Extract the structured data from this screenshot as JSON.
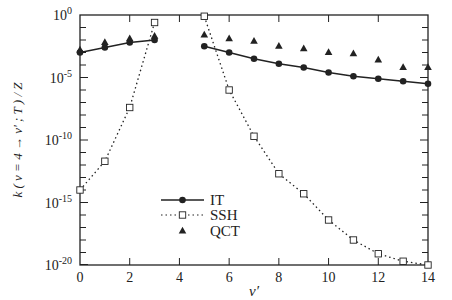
{
  "chart_data": {
    "type": "line",
    "title": "",
    "xlabel": "v′",
    "ylabel": "k ( v = 4 → v′ ; T ) / Z",
    "xlim": [
      0,
      14
    ],
    "ylim_log10": [
      -20,
      0
    ],
    "yscale": "log",
    "grid": false,
    "legend_position": "lower-left-center",
    "x_ticks": [
      0,
      2,
      4,
      6,
      8,
      10,
      12,
      14
    ],
    "x_tick_labels": [
      "0",
      "2",
      "4",
      "6",
      "8",
      "10",
      "12",
      "14"
    ],
    "y_ticks_log10": [
      0,
      -5,
      -10,
      -15,
      -20
    ],
    "y_tick_labels": [
      {
        "base": "10",
        "exp": "0"
      },
      {
        "base": "10",
        "exp": "-5"
      },
      {
        "base": "10",
        "exp": "-10"
      },
      {
        "base": "10",
        "exp": "-15"
      },
      {
        "base": "10",
        "exp": "-20"
      }
    ],
    "series": [
      {
        "name": "IT",
        "style": "solid-line-filled-circle",
        "segments": [
          {
            "x": [
              0,
              1,
              2,
              3
            ],
            "log10_y": [
              -3.0,
              -2.6,
              -2.2,
              -2.0
            ]
          },
          {
            "x": [
              5,
              6,
              7,
              8,
              9,
              10,
              11,
              12,
              13,
              14
            ],
            "log10_y": [
              -2.5,
              -3.0,
              -3.5,
              -3.9,
              -4.2,
              -4.6,
              -4.9,
              -5.1,
              -5.3,
              -5.5
            ]
          }
        ]
      },
      {
        "name": "SSH",
        "style": "dotted-line-open-square",
        "segments": [
          {
            "x": [
              0,
              1,
              2,
              3
            ],
            "log10_y": [
              -14.0,
              -11.7,
              -7.4,
              -0.6
            ]
          },
          {
            "x": [
              5,
              6,
              7,
              8,
              9,
              10,
              11,
              12,
              13,
              14
            ],
            "log10_y": [
              -0.1,
              -6.0,
              -9.7,
              -12.7,
              -14.3,
              -16.4,
              -18.0,
              -19.1,
              -19.7,
              -20.0
            ]
          }
        ]
      },
      {
        "name": "QCT",
        "style": "filled-triangle-markers",
        "segments": [
          {
            "x": [
              0,
              1,
              2,
              3
            ],
            "log10_y": [
              -2.8,
              -2.2,
              -1.9,
              -1.7
            ]
          },
          {
            "x": [
              5,
              6,
              7,
              8,
              9,
              10,
              11,
              12,
              13,
              14
            ],
            "log10_y": [
              -1.6,
              -1.9,
              -2.1,
              -2.5,
              -2.7,
              -3.0,
              -3.1,
              -3.6,
              -4.2,
              -4.2
            ]
          }
        ]
      }
    ]
  },
  "legend": {
    "items": [
      {
        "label": "IT"
      },
      {
        "label": "SSH"
      },
      {
        "label": "QCT"
      }
    ]
  },
  "axes": {
    "xlabel": "v′",
    "ylabel": "k ( v = 4 → v′ ; T ) / Z"
  },
  "colors": {
    "ink": "#222222",
    "background": "#ffffff"
  }
}
